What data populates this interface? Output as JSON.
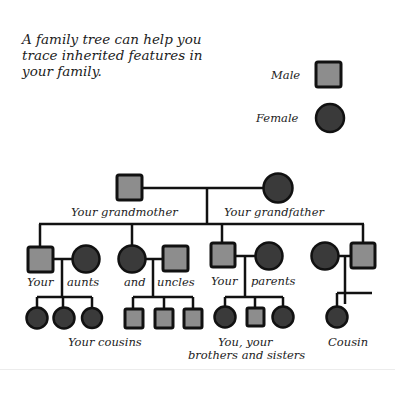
{
  "intro": {
    "lines": [
      "A family tree can help you",
      "trace inherited features in",
      "your family."
    ]
  },
  "legend": {
    "male_label": "Male",
    "female_label": "Female",
    "male_symbol": "grey-square",
    "female_symbol": "dark-circle"
  },
  "colors": {
    "male_fill": "#8d8d8d",
    "female_fill": "#3a3a3a",
    "line": "#111111"
  },
  "tree": {
    "generation1": {
      "left_label": "Your grandmother",
      "right_label": "Your grandfather"
    },
    "generation2": {
      "labels": [
        "Your",
        "aunts",
        "and",
        "uncles",
        "Your",
        "parents"
      ]
    },
    "generation3": {
      "cousins_label": "Your cousins",
      "siblings_label_line1": "You, your",
      "siblings_label_line2": "brothers and sisters",
      "cousin_label": "Cousin"
    }
  }
}
